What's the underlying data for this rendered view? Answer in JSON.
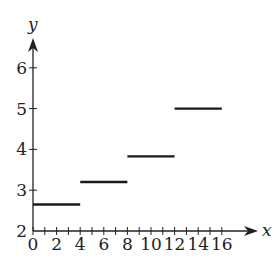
{
  "chart_data": {
    "type": "line",
    "subtype": "step-function",
    "title": "",
    "xlabel": "x",
    "ylabel": "y",
    "xlim": [
      0,
      16
    ],
    "ylim": [
      2,
      6
    ],
    "x_ticks": [
      0,
      2,
      4,
      6,
      8,
      10,
      12,
      14,
      16
    ],
    "x_minor_step": 1,
    "y_ticks": [
      2,
      3,
      4,
      5,
      6
    ],
    "grid": false,
    "legend": null,
    "series": [
      {
        "name": "step",
        "segments": [
          {
            "x_start": 0,
            "x_end": 4,
            "y": 2.65
          },
          {
            "x_start": 4,
            "x_end": 8,
            "y": 3.2
          },
          {
            "x_start": 8,
            "x_end": 12,
            "y": 3.83
          },
          {
            "x_start": 12,
            "x_end": 16,
            "y": 5.0
          }
        ]
      }
    ]
  },
  "style": {
    "axis_color": "#222222",
    "segment_color": "#1a1a1a"
  }
}
